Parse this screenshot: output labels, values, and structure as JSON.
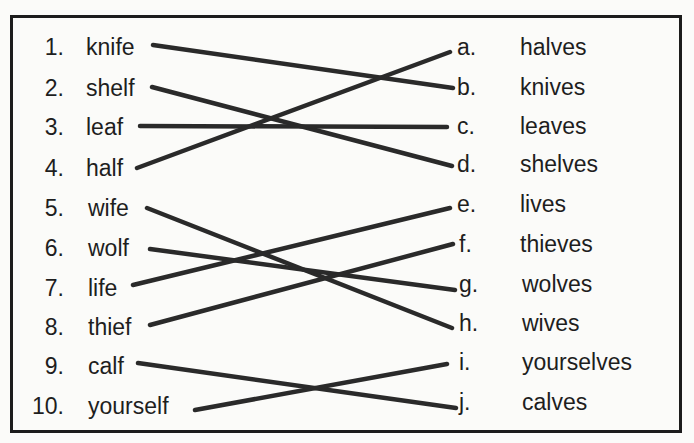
{
  "exercise": {
    "left_items": [
      {
        "number": "1.",
        "word": "knife"
      },
      {
        "number": "2.",
        "word": "shelf"
      },
      {
        "number": "3.",
        "word": "leaf"
      },
      {
        "number": "4.",
        "word": "half"
      },
      {
        "number": "5.",
        "word": "wife"
      },
      {
        "number": "6.",
        "word": "wolf"
      },
      {
        "number": "7.",
        "word": "life"
      },
      {
        "number": "8.",
        "word": "thief"
      },
      {
        "number": "9.",
        "word": "calf"
      },
      {
        "number": "10.",
        "word": "yourself"
      }
    ],
    "right_items": [
      {
        "letter": "a.",
        "word": "halves"
      },
      {
        "letter": "b.",
        "word": "knives"
      },
      {
        "letter": "c.",
        "word": "leaves"
      },
      {
        "letter": "d.",
        "word": "shelves"
      },
      {
        "letter": "e.",
        "word": "lives"
      },
      {
        "letter": "f.",
        "word": "thieves"
      },
      {
        "letter": "g.",
        "word": "wolves"
      },
      {
        "letter": "h.",
        "word": "wives"
      },
      {
        "letter": "i.",
        "word": "yourselves"
      },
      {
        "letter": "j.",
        "word": "calves"
      }
    ],
    "matches": [
      {
        "from": "1",
        "to": "b"
      },
      {
        "from": "2",
        "to": "d"
      },
      {
        "from": "3",
        "to": "c"
      },
      {
        "from": "4",
        "to": "a"
      },
      {
        "from": "5",
        "to": "h"
      },
      {
        "from": "6",
        "to": "g"
      },
      {
        "from": "7",
        "to": "e"
      },
      {
        "from": "8",
        "to": "f"
      },
      {
        "from": "9",
        "to": "j"
      },
      {
        "from": "10",
        "to": "i"
      }
    ],
    "line_color": "#2a2a2a"
  }
}
